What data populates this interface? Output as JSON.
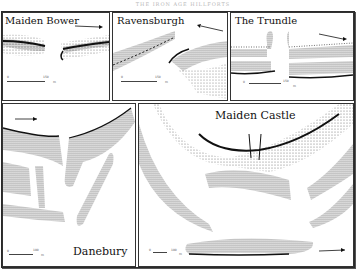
{
  "header": {
    "text": "THE IRON AGE HILLFORTS"
  },
  "panels": [
    {
      "id": "maiden-bower",
      "title": "Maiden Bower",
      "scale": {
        "start": "0",
        "end": "150",
        "unit": "m"
      }
    },
    {
      "id": "ravensburgh",
      "title": "Ravensburgh",
      "scale": {
        "start": "0",
        "end": "150",
        "unit": "m"
      }
    },
    {
      "id": "the-trundle",
      "title": "The Trundle",
      "scale": {
        "start": "0",
        "end": "150",
        "unit": "m"
      }
    },
    {
      "id": "danebury",
      "title": "Danebury",
      "scale": {
        "start": "0",
        "end": "100",
        "unit": "m"
      }
    },
    {
      "id": "maiden-castle",
      "title": "Maiden Castle",
      "scale": {
        "start": "0",
        "end": "100",
        "unit": "m"
      }
    }
  ],
  "icons": {
    "north_arrow": "north-arrow-icon"
  },
  "colors": {
    "ink": "#111111",
    "paper": "#ffffff",
    "border": "#333333"
  }
}
